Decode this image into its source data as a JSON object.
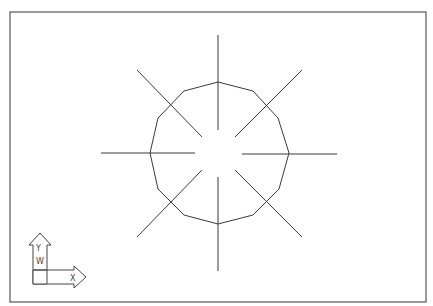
{
  "viewport": {
    "frame": {
      "x": 10,
      "y": 12,
      "width": 416,
      "height": 290
    },
    "colors": {
      "background": "#ffffff",
      "lines": "#3a3a3a",
      "frame": "#555555"
    }
  },
  "drawing": {
    "polygon": {
      "sides": 12,
      "points": "218,82 253,91 278,118 289,153 279,189 253,215 218,224 184,215 158,189 150,153 158,118 184,91"
    },
    "rays": [
      {
        "name": "ray-north",
        "x1": 218,
        "y1": 35,
        "x2": 218,
        "y2": 130
      },
      {
        "name": "ray-south",
        "x1": 218,
        "y1": 177,
        "x2": 218,
        "y2": 271
      },
      {
        "name": "ray-west",
        "x1": 101,
        "y1": 153,
        "x2": 195,
        "y2": 153
      },
      {
        "name": "ray-east",
        "x1": 242,
        "y1": 154,
        "x2": 337,
        "y2": 154
      },
      {
        "name": "ray-northwest",
        "x1": 137,
        "y1": 70,
        "x2": 202,
        "y2": 137
      },
      {
        "name": "ray-northeast",
        "x1": 302,
        "y1": 70,
        "x2": 235,
        "y2": 137
      },
      {
        "name": "ray-southwest",
        "x1": 137,
        "y1": 237,
        "x2": 202,
        "y2": 170
      },
      {
        "name": "ray-southeast",
        "x1": 302,
        "y1": 237,
        "x2": 235,
        "y2": 170
      }
    ]
  },
  "ucs_icon": {
    "x_label": "X",
    "y_label": "Y",
    "w_label": "W"
  }
}
